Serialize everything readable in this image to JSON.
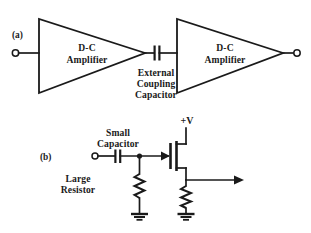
{
  "figure": {
    "panels": [
      {
        "id": "panel-a",
        "label": "(a)",
        "blocks": [
          {
            "id": "amp1",
            "line1": "D-C",
            "line2": "Amplifier"
          },
          {
            "id": "amp2",
            "line1": "D-C",
            "line2": "Amplifier"
          }
        ],
        "component_label": {
          "id": "coupling-capacitor-label",
          "line1": "External",
          "line2": "Coupling",
          "line3": "Capacitor"
        }
      },
      {
        "id": "panel-b",
        "label": "(b)",
        "labels": {
          "capacitor_line1": "Small",
          "capacitor_line2": "Capacitor",
          "resistor_line1": "Large",
          "resistor_line2": "Resistor",
          "supply": "+V"
        }
      }
    ]
  },
  "colors": {
    "ink": "#1a1a1a",
    "background": "#ffffff"
  }
}
